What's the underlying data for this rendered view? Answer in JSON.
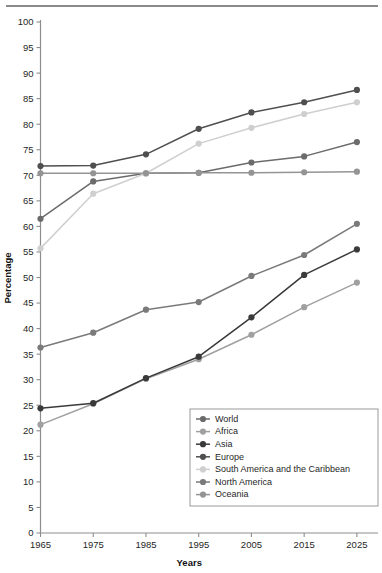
{
  "chart_data": {
    "type": "line",
    "title": "",
    "xlabel": "Years",
    "ylabel": "Percentage",
    "categories": [
      "1965",
      "1975",
      "1985",
      "1995",
      "2005",
      "2015",
      "2025"
    ],
    "x": [
      1965,
      1975,
      1985,
      1995,
      2005,
      2015,
      2025
    ],
    "xlim": [
      1965,
      2029
    ],
    "ylim": [
      0,
      100
    ],
    "ytick_step": 5,
    "yticks": [
      0,
      5,
      10,
      15,
      20,
      25,
      30,
      35,
      40,
      45,
      50,
      55,
      60,
      65,
      70,
      75,
      80,
      85,
      90,
      95,
      100
    ],
    "grid": false,
    "legend_position": "lower-right-inside",
    "series": [
      {
        "name": "World",
        "color": "#6b6b6b",
        "values": [
          61.5,
          68.8,
          70.4,
          70.5,
          72.5,
          73.7,
          76.5
        ]
      },
      {
        "name": "Africa",
        "color": "#a0a0a0",
        "values": [
          21.2,
          25.3,
          30.2,
          34.0,
          38.8,
          44.2,
          49.0
        ]
      },
      {
        "name": "Asia",
        "color": "#3a3a3a",
        "values": [
          24.4,
          25.4,
          30.3,
          34.5,
          42.2,
          50.5,
          55.5
        ]
      },
      {
        "name": "Europe",
        "color": "#4f4f4f",
        "values": [
          71.8,
          71.9,
          74.1,
          79.1,
          82.3,
          84.3,
          86.7
        ]
      },
      {
        "name": "South America and the Caribbean",
        "color": "#cfcfcf",
        "values": [
          55.7,
          66.4,
          70.4,
          76.2,
          79.3,
          82.0,
          84.3
        ]
      },
      {
        "name": "North America",
        "color": "#7a7a7a",
        "values": [
          36.3,
          39.2,
          43.7,
          45.2,
          50.3,
          54.4,
          60.5
        ]
      },
      {
        "name": "Oceania",
        "color": "#949494",
        "values": [
          70.4,
          70.4,
          70.4,
          70.5,
          70.5,
          70.6,
          70.7
        ]
      }
    ]
  },
  "axes": {
    "x_title": "Years",
    "y_title": "Percentage"
  },
  "legend": {
    "entries": [
      "World",
      "Africa",
      "Asia",
      "Europe",
      "South America and the Caribbean",
      "North America",
      "Oceania"
    ]
  }
}
